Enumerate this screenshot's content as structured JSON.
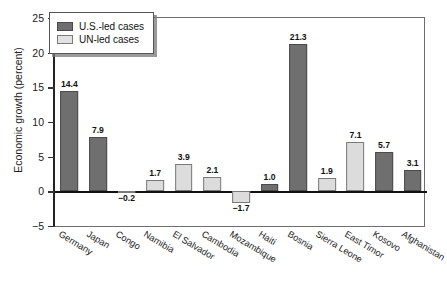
{
  "chart_data": {
    "type": "bar",
    "title": "",
    "xlabel": "",
    "ylabel": "Economic growth (percent)",
    "ylim": [
      -5,
      25
    ],
    "yticks": [
      -5,
      0,
      5,
      10,
      15,
      20,
      25
    ],
    "grid": false,
    "legend_position": "upper left",
    "categories": [
      "Germany",
      "Japan",
      "Congo",
      "Namibia",
      "El Salvador",
      "Cambodia",
      "Mozambique",
      "Haiti",
      "Bosnia",
      "Sierra Leone",
      "East Timor",
      "Kosovo",
      "Afghanistan"
    ],
    "series": [
      {
        "name": "U.S.-led cases",
        "color": "#6f6f6f"
      },
      {
        "name": "UN-led cases",
        "color": "#dcdcdc"
      }
    ],
    "points": [
      {
        "category": "Germany",
        "value": 14.4,
        "label": "14.4",
        "series": "U.S.-led cases"
      },
      {
        "category": "Japan",
        "value": 7.9,
        "label": "7.9",
        "series": "U.S.-led cases"
      },
      {
        "category": "Congo",
        "value": -0.2,
        "label": "−0.2",
        "series": "UN-led cases"
      },
      {
        "category": "Namibia",
        "value": 1.7,
        "label": "1.7",
        "series": "UN-led cases"
      },
      {
        "category": "El Salvador",
        "value": 3.9,
        "label": "3.9",
        "series": "UN-led cases"
      },
      {
        "category": "Cambodia",
        "value": 2.1,
        "label": "2.1",
        "series": "UN-led cases"
      },
      {
        "category": "Mozambique",
        "value": -1.7,
        "label": "−1.7",
        "series": "UN-led cases"
      },
      {
        "category": "Haiti",
        "value": 1.0,
        "label": "1.0",
        "series": "U.S.-led cases"
      },
      {
        "category": "Bosnia",
        "value": 21.3,
        "label": "21.3",
        "series": "U.S.-led cases"
      },
      {
        "category": "Sierra Leone",
        "value": 1.9,
        "label": "1.9",
        "series": "UN-led cases"
      },
      {
        "category": "East Timor",
        "value": 7.1,
        "label": "7.1",
        "series": "UN-led cases"
      },
      {
        "category": "Kosovo",
        "value": 5.7,
        "label": "5.7",
        "series": "U.S.-led cases"
      },
      {
        "category": "Afghanistan",
        "value": 3.1,
        "label": "3.1",
        "series": "U.S.-led cases"
      }
    ]
  },
  "axis": {
    "ytitle": "Economic growth (percent)",
    "ytick_labels": [
      "25",
      "20",
      "15",
      "10",
      "5",
      "0",
      "−5"
    ]
  },
  "legend": {
    "entries": [
      {
        "label": "U.S.-led cases",
        "key": "us"
      },
      {
        "label": "UN-led cases",
        "key": "un"
      }
    ]
  }
}
